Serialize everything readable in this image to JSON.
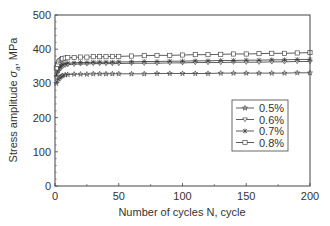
{
  "chart_data": {
    "type": "line",
    "title": "",
    "xlabel": "Number of cycles N, cycle",
    "ylabel": "Stress amplitude σa, MPa",
    "xlim": [
      0,
      200
    ],
    "ylim": [
      0,
      500
    ],
    "xticks": [
      0,
      50,
      100,
      150,
      200
    ],
    "yticks": [
      0,
      100,
      200,
      300,
      400,
      500
    ],
    "grid": false,
    "legend_position": "center-right inside plot",
    "x": [
      1,
      2,
      3,
      4,
      5,
      6,
      8,
      10,
      15,
      20,
      25,
      30,
      35,
      40,
      45,
      50,
      60,
      70,
      80,
      90,
      100,
      110,
      120,
      130,
      140,
      150,
      160,
      170,
      180,
      190,
      200
    ],
    "series": [
      {
        "name": "0.5%",
        "marker": "star",
        "values": [
          300,
          308,
          314,
          318,
          321,
          323,
          325,
          326,
          327,
          327,
          327,
          328,
          328,
          328,
          328,
          328,
          328,
          328,
          329,
          329,
          329,
          329,
          329,
          330,
          330,
          330,
          330,
          330,
          330,
          331,
          331
        ]
      },
      {
        "name": "0.6%",
        "marker": "triangle-down",
        "values": [
          318,
          330,
          338,
          343,
          347,
          350,
          353,
          355,
          356,
          357,
          357,
          358,
          358,
          358,
          358,
          358,
          359,
          359,
          359,
          360,
          360,
          361,
          361,
          361,
          362,
          362,
          362,
          363,
          363,
          364,
          364
        ]
      },
      {
        "name": "0.7%",
        "marker": "x",
        "values": [
          325,
          336,
          343,
          348,
          352,
          355,
          357,
          359,
          360,
          361,
          361,
          362,
          362,
          362,
          362,
          363,
          363,
          364,
          364,
          365,
          365,
          366,
          366,
          367,
          367,
          368,
          368,
          369,
          369,
          370,
          370
        ]
      },
      {
        "name": "0.8%",
        "marker": "square",
        "values": [
          345,
          356,
          363,
          367,
          370,
          372,
          374,
          375,
          376,
          377,
          377,
          378,
          378,
          378,
          379,
          379,
          380,
          381,
          382,
          382,
          383,
          384,
          384,
          385,
          386,
          386,
          387,
          388,
          388,
          389,
          390
        ]
      }
    ]
  }
}
